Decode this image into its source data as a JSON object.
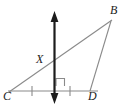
{
  "figure": {
    "type": "geometry-diagram",
    "background_color": "#ffffff",
    "stroke_color": "#8a8a8a",
    "axis_color": "#1c1c1c",
    "label_color": "#1c1c1c"
  },
  "labels": {
    "b": "B",
    "c": "C",
    "d": "D",
    "x": "X"
  },
  "points": {
    "B": {
      "x": 110,
      "y": 20
    },
    "C": {
      "x": 10,
      "y": 91
    },
    "D": {
      "x": 90,
      "y": 91
    },
    "M": {
      "x": 54,
      "y": 91
    },
    "X": {
      "x": 54,
      "y": 62
    }
  },
  "segments": [
    {
      "name": "CB",
      "from": "C",
      "to": "B"
    },
    {
      "name": "CD",
      "from": "C",
      "to": "D"
    },
    {
      "name": "BD",
      "from": "B",
      "to": "D"
    }
  ],
  "line": {
    "name": "perpendicular-bisector",
    "x": 54,
    "y_top": 12,
    "y_bottom": 103,
    "arrow_both_ends": true
  },
  "tick_marks": [
    {
      "name": "tick-cm",
      "x": 32,
      "y": 91
    },
    {
      "name": "tick-md",
      "x": 70,
      "y": 91
    }
  ],
  "right_angle": {
    "name": "right-angle-mark",
    "x": 56,
    "y": 78,
    "size": 8
  }
}
